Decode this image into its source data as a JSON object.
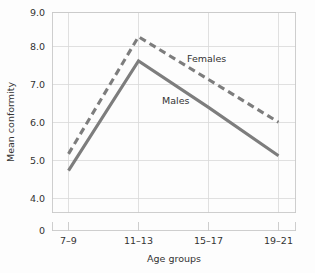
{
  "chart_data": {
    "type": "line",
    "title": "",
    "xlabel": "Age groups",
    "ylabel": "Mean conformity",
    "categories": [
      "7–9",
      "11–13",
      "15–17",
      "19–21"
    ],
    "series": [
      {
        "name": "Females",
        "values": [
          5.2,
          8.35,
          7.2,
          6.05
        ],
        "style": "dashed",
        "color": "#7d7d7d"
      },
      {
        "name": "Males",
        "values": [
          4.75,
          7.7,
          6.45,
          5.15
        ],
        "style": "solid",
        "color": "#7d7d7d"
      }
    ],
    "ylim": [
      4.0,
      9.0
    ],
    "y_ticks": [
      "4.0",
      "5.0",
      "6.0",
      "7.0",
      "8.0",
      "9.0"
    ],
    "y_axis_break_label": "0",
    "grid": true,
    "legend_position": "inline-annotations",
    "annotations": [
      {
        "text": "Females",
        "x_frac": 0.62,
        "value": 7.55
      },
      {
        "text": "Males",
        "x_frac": 0.47,
        "value": 6.62
      }
    ]
  },
  "colors": {
    "line": "#7d7d7d",
    "grid": "#d8d8d8",
    "frame": "#c9c9c9",
    "text": "#333333",
    "background": "#fdfdfd"
  },
  "axes": {
    "y_title": "Mean conformity",
    "x_title": "Age groups",
    "y_tick_0": "4.0",
    "y_tick_1": "5.0",
    "y_tick_2": "6.0",
    "y_tick_3": "7.0",
    "y_tick_4": "8.0",
    "y_tick_5": "9.0",
    "y_zero": "0",
    "x_tick_0": "7–9",
    "x_tick_1": "11–13",
    "x_tick_2": "15–17",
    "x_tick_3": "19–21"
  },
  "labels": {
    "females": "Females",
    "males": "Males"
  }
}
